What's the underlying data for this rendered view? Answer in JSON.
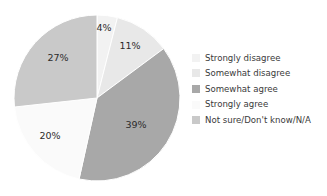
{
  "chart_data": {
    "type": "pie",
    "title": "",
    "categories": [
      "Strongly disagree",
      "Somewhat disagree",
      "Somewhat agree",
      "Strongly agree",
      "Not sure/Don't know/N/A"
    ],
    "values": [
      4,
      11,
      39,
      20,
      27
    ],
    "data_labels": [
      "4%",
      "11%",
      "39%",
      "20%",
      "27%"
    ],
    "colors": [
      "#f2f2f2",
      "#e8e8e8",
      "#a8a8a8",
      "#fafafa",
      "#c9c9c9"
    ],
    "legend_position": "right",
    "grid": false,
    "start_angle_deg": 0,
    "direction": "clockwise",
    "units": "percent"
  },
  "legend": {
    "items": [
      {
        "label": "Strongly disagree",
        "color": "#f2f2f2"
      },
      {
        "label": "Somewhat disagree",
        "color": "#e8e8e8"
      },
      {
        "label": "Somewhat agree",
        "color": "#a8a8a8"
      },
      {
        "label": "Strongly agree",
        "color": "#fafafa"
      },
      {
        "label": "Not sure/Don't know/N/A",
        "color": "#c9c9c9"
      }
    ]
  },
  "pie_geometry": {
    "cx": 97,
    "cy": 98,
    "r": 83
  },
  "slice_labels": [
    {
      "text": "4%",
      "x": 104,
      "y": 28
    },
    {
      "text": "11%",
      "x": 130,
      "y": 46
    },
    {
      "text": "39%",
      "x": 136,
      "y": 125
    },
    {
      "text": "20%",
      "x": 50,
      "y": 136
    },
    {
      "text": "27%",
      "x": 58,
      "y": 58
    }
  ]
}
